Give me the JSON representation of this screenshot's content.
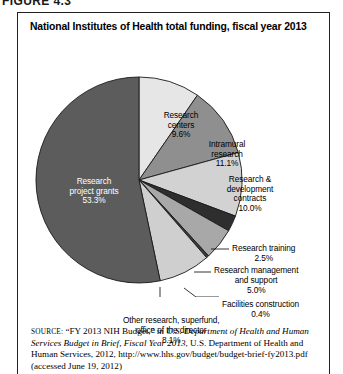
{
  "figure_number": "FIGURE 4.3",
  "chart_title": "National Institutes of Health total funding, fiscal year 2013",
  "chart_data": {
    "type": "pie",
    "title": "National Institutes of Health total funding, fiscal year 2013",
    "unit": "percent",
    "start_angle_deg": 0,
    "direction": "clockwise",
    "categories": [
      "Research centers",
      "Intramural research",
      "Research & development contracts",
      "Research training",
      "Research management and support",
      "Facilities construction",
      "Other research, superfund, office of the director",
      "Research project grants"
    ],
    "values": [
      9.6,
      11.1,
      10.0,
      2.5,
      5.0,
      0.4,
      8.1,
      53.3
    ],
    "slices": [
      {
        "name": "Research centers",
        "label_line1": "Research",
        "label_line2": "centers",
        "value_label": "9.6%",
        "value": 9.6,
        "color": "#e6e6e6",
        "label_placement": "inside",
        "text_on": "light"
      },
      {
        "name": "Intramural research",
        "label_line1": "Intramural",
        "label_line2": "research",
        "value_label": "11.1%",
        "value": 11.1,
        "color": "#8f8f8f",
        "label_placement": "inside",
        "text_on": "light"
      },
      {
        "name": "Research & development contracts",
        "label_line1": "Research &",
        "label_line2": "development",
        "label_line3": "contracts",
        "value_label": "10.0%",
        "value": 10.0,
        "color": "#d2d2d2",
        "label_placement": "inside",
        "text_on": "light"
      },
      {
        "name": "Research training",
        "label_line1": "Research training",
        "value_label": "2.5%",
        "value": 2.5,
        "color": "#2e2e2e",
        "label_placement": "callout"
      },
      {
        "name": "Research management and support",
        "label_line1": "Research management",
        "label_line2": "and support",
        "value_label": "5.0%",
        "value": 5.0,
        "color": "#a8a8a8",
        "label_placement": "callout"
      },
      {
        "name": "Facilities construction",
        "label_line1": "Facilities construction",
        "value_label": "0.4%",
        "value": 0.4,
        "color": "#3d3d3d",
        "label_placement": "callout"
      },
      {
        "name": "Other research, superfund, office of the director",
        "label_line1": "Other research, superfund,",
        "label_line2": "office of the director",
        "value_label": "8.1%",
        "value": 8.1,
        "color": "#cfcfcf",
        "label_placement": "callout"
      },
      {
        "name": "Research project grants",
        "label_line1": "Research",
        "label_line2": "project grants",
        "value_label": "53.3%",
        "value": 53.3,
        "color": "#5c5c5c",
        "label_placement": "inside",
        "text_on": "dark"
      }
    ]
  },
  "source": {
    "source_word": "SOURCE:",
    "text_part1": " “FY 2013 NIH Budget,” in ",
    "italic_part1": "U.S. Department of Health and Human Services Budget in Brief, Fiscal Year 2013",
    "text_part2": ", U.S. Department of Health and Human Services, 2012, http://www.hhs.gov/budget/budget-brief-fy2013.pdf (accessed June 19, 2012)"
  }
}
